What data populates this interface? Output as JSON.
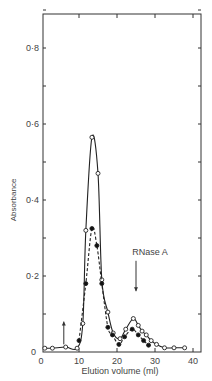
{
  "chart_data": {
    "type": "line",
    "title": "",
    "xlabel": "Elution volume (ml)",
    "ylabel": "Absorbance",
    "xlim": [
      0,
      42
    ],
    "ylim": [
      0,
      0.9
    ],
    "xticks": [
      0,
      10,
      20,
      30,
      40
    ],
    "xtick_labels": [
      "0",
      "10",
      "20",
      "30",
      "40"
    ],
    "yticks": [
      0,
      0.2,
      0.4,
      0.6,
      0.8
    ],
    "ytick_labels": [
      "0",
      "0·2",
      "0·4",
      "0·6",
      "0·8"
    ],
    "grid": false,
    "legend": null,
    "series": [
      {
        "name": "open circles (solid line)",
        "marker": "open-circle",
        "line": "solid",
        "x": [
          1,
          3,
          6.5,
          9.5,
          11,
          11.8,
          13.4,
          15,
          16,
          17.6,
          19,
          20.8,
          22.3,
          24.3,
          25.6,
          26.6,
          27.7,
          29,
          30.4,
          32.5,
          35,
          37.8
        ],
        "y": [
          0.01,
          0.01,
          0.013,
          0.01,
          0.075,
          0.32,
          0.565,
          0.47,
          0.19,
          0.105,
          0.05,
          0.035,
          0.06,
          0.088,
          0.07,
          0.055,
          0.045,
          0.03,
          0.02,
          0.011,
          0.011,
          0.011
        ]
      },
      {
        "name": "filled circles (dashed line)",
        "marker": "filled-circle",
        "line": "dashed",
        "x": [
          10,
          11.8,
          13.4,
          14.7,
          16,
          17.6,
          18.8,
          20.5,
          22,
          24,
          25.6,
          27,
          28.3
        ],
        "y": [
          0.03,
          0.18,
          0.325,
          0.28,
          0.18,
          0.065,
          0.045,
          0.02,
          0.04,
          0.06,
          0.045,
          0.03,
          0.018
        ]
      }
    ],
    "annotations": [
      {
        "text": "RNase A",
        "type": "down-arrow",
        "x": 25,
        "y_from": 0.24,
        "y_to": 0.16
      },
      {
        "text": "",
        "type": "up-arrow",
        "x": 6,
        "y_from": 0.02,
        "y_to": 0.08
      }
    ]
  }
}
